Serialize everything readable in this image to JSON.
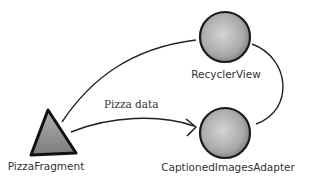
{
  "diagram": {
    "nodes": [
      {
        "id": "pizza_fragment",
        "label": "PizzaFragment",
        "shape": "triangle"
      },
      {
        "id": "recycler_view",
        "label": "RecyclerView",
        "shape": "sphere"
      },
      {
        "id": "captioned_images_adapter",
        "label": "CaptionedImagesAdapter",
        "shape": "sphere"
      }
    ],
    "edges": [
      {
        "from": "pizza_fragment",
        "to": "recycler_view",
        "label": ""
      },
      {
        "from": "pizza_fragment",
        "to": "captioned_images_adapter",
        "label": "Pizza data",
        "arrow": true
      },
      {
        "from": "recycler_view",
        "to": "captioned_images_adapter",
        "label": ""
      }
    ]
  },
  "colors": {
    "stroke": "#222222",
    "fill": "#a8a8a8",
    "text": "#333333"
  }
}
